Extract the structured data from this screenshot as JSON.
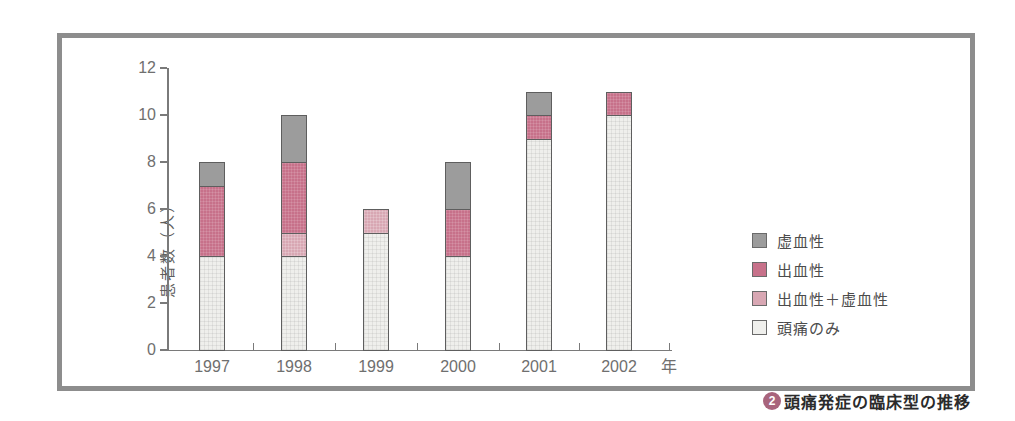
{
  "figure": {
    "caption_badge": "2",
    "caption": "頭痛発症の臨床型の推移"
  },
  "colors": {
    "ischemic": "#9c9c9c",
    "hemorrhagic": "#c7718a",
    "hemo_plus_ische": "#d8a7b3",
    "headache_only": "#efefec",
    "bar_border": "#5e5e5e",
    "axis": "#7a7a7a",
    "frame_border": "#8d8d8d",
    "badge": "#a8647c",
    "tick_text": "#6f6f6f"
  },
  "chart_data": {
    "type": "bar",
    "stacked": true,
    "title": "",
    "xlabel": "",
    "ylabel": "患者数（人）",
    "x_axis_unit": "年",
    "categories": [
      "1997",
      "1998",
      "1999",
      "2000",
      "2001",
      "2002"
    ],
    "y_ticks": [
      0,
      2,
      4,
      6,
      8,
      10,
      12
    ],
    "ylim": [
      0,
      12
    ],
    "grid": false,
    "legend_position": "right",
    "series": [
      {
        "name": "頭痛のみ",
        "key": "headache_only",
        "values": [
          4,
          4,
          5,
          4,
          9,
          10
        ]
      },
      {
        "name": "出血性＋虚血性",
        "key": "hemo_plus_ische",
        "values": [
          0,
          1,
          1,
          0,
          0,
          0
        ]
      },
      {
        "name": "出血性",
        "key": "hemorrhagic",
        "values": [
          3,
          3,
          0,
          2,
          1,
          1
        ]
      },
      {
        "name": "虚血性",
        "key": "ischemic",
        "values": [
          1,
          2,
          0,
          2,
          1,
          0
        ]
      }
    ],
    "totals": [
      8,
      10,
      6,
      8,
      11,
      11
    ],
    "legend": [
      {
        "label": "虚血性",
        "key": "ischemic"
      },
      {
        "label": "出血性",
        "key": "hemorrhagic"
      },
      {
        "label": "出血性＋虚血性",
        "key": "hemo_plus_ische"
      },
      {
        "label": "頭痛のみ",
        "key": "headache_only"
      }
    ]
  }
}
